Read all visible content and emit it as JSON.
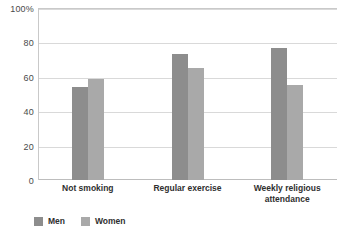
{
  "chart_data": {
    "type": "bar",
    "title": "",
    "subtitle": "",
    "xlabel": "",
    "ylabel": "",
    "ylim": [
      0,
      100
    ],
    "yticks": [
      0,
      20,
      40,
      60,
      80,
      100
    ],
    "ytick_labels": [
      "0",
      "20",
      "40",
      "60",
      "80",
      "100%"
    ],
    "grid": true,
    "legend_position": "bottom-left",
    "categories": [
      {
        "line1": "Not smoking",
        "line2": ""
      },
      {
        "line1": "Regular exercise",
        "line2": ""
      },
      {
        "line1": "Weekly religious",
        "line2": "attendance"
      }
    ],
    "category_labels": [
      "Not smoking",
      "Regular exercise",
      "Weekly religious attendance"
    ],
    "series": [
      {
        "name": "Men",
        "color": "#8d8d8d",
        "values": [
          54,
          73,
          77
        ]
      },
      {
        "name": "Women",
        "color": "#a9a9a9",
        "values": [
          58.5,
          65,
          55
        ]
      }
    ]
  },
  "legend": {
    "items": [
      {
        "label": "Men",
        "color": "#8d8d8d"
      },
      {
        "label": "Women",
        "color": "#a9a9a9"
      }
    ]
  },
  "axis": {
    "y_ticks": [
      {
        "value": 100,
        "label": "100%"
      },
      {
        "value": 80,
        "label": "80"
      },
      {
        "value": 60,
        "label": "60"
      },
      {
        "value": 40,
        "label": "40"
      },
      {
        "value": 20,
        "label": "20"
      },
      {
        "value": 0,
        "label": "0"
      }
    ]
  }
}
